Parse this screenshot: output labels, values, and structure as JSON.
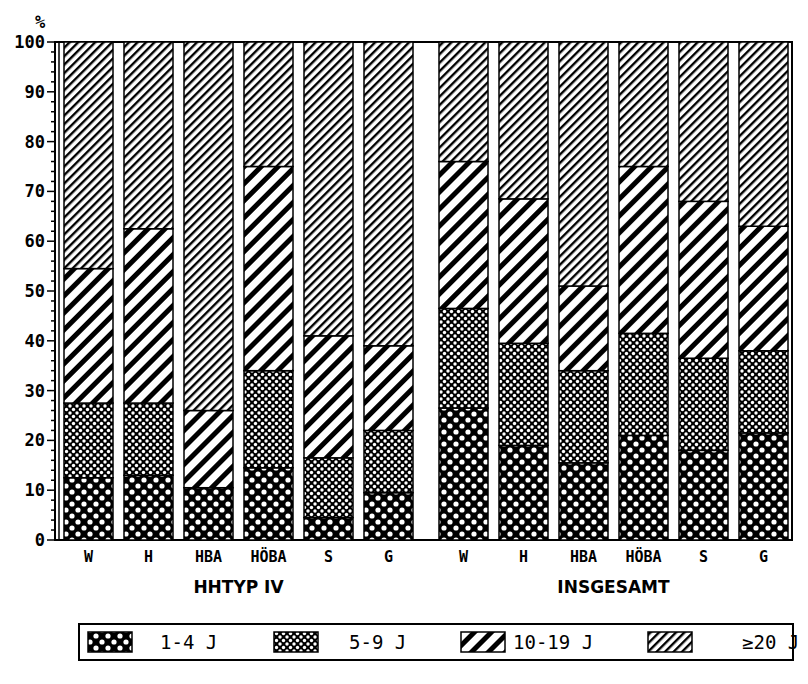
{
  "chart_data": {
    "type": "bar",
    "stacked": true,
    "percent": true,
    "title": "",
    "ylabel": "%",
    "xlabel": "",
    "ylim": [
      0,
      100
    ],
    "yticks": [
      0,
      10,
      20,
      30,
      40,
      50,
      60,
      70,
      80,
      90,
      100
    ],
    "grid": false,
    "legend_position": "bottom",
    "groups": [
      {
        "name": "HHTYP IV",
        "categories": [
          "W",
          "H",
          "HBA",
          "HÖBA",
          "S",
          "G"
        ],
        "series": [
          {
            "name": "1-4 J",
            "values": [
              12.5,
              13.0,
              10.5,
              14.5,
              4.5,
              9.5
            ]
          },
          {
            "name": "5-9 J",
            "values": [
              15.0,
              14.5,
              0.0,
              19.5,
              12.0,
              12.5
            ]
          },
          {
            "name": "10-19 J",
            "values": [
              27.0,
              35.0,
              15.5,
              41.0,
              24.5,
              17.0
            ]
          },
          {
            "name": "≥20 J",
            "values": [
              45.5,
              37.5,
              74.0,
              25.0,
              59.0,
              61.0
            ]
          }
        ]
      },
      {
        "name": "INSGESAMT",
        "categories": [
          "W",
          "H",
          "HBA",
          "HÖBA",
          "S",
          "G"
        ],
        "series": [
          {
            "name": "1-4 J",
            "values": [
              26.5,
              19.0,
              15.5,
              21.0,
              18.0,
              21.5
            ]
          },
          {
            "name": "5-9 J",
            "values": [
              20.0,
              20.5,
              18.5,
              20.5,
              18.5,
              16.5
            ]
          },
          {
            "name": "10-19 J",
            "values": [
              29.5,
              29.0,
              17.0,
              33.5,
              31.5,
              25.0
            ]
          },
          {
            "name": "≥20 J",
            "values": [
              24.0,
              31.5,
              49.0,
              25.0,
              32.0,
              37.0
            ]
          }
        ]
      }
    ],
    "legend": [
      {
        "label": "1-4 J",
        "pattern": "coarse-crosshatch"
      },
      {
        "label": "5-9 J",
        "pattern": "fine-crosshatch"
      },
      {
        "label": "10-19 J",
        "pattern": "wide-diagonal"
      },
      {
        "label": "≥20 J",
        "pattern": "fine-diagonal"
      }
    ]
  },
  "axis": {
    "unit_label": "%"
  },
  "colors": {
    "ink": "#000000",
    "paper": "#ffffff"
  }
}
